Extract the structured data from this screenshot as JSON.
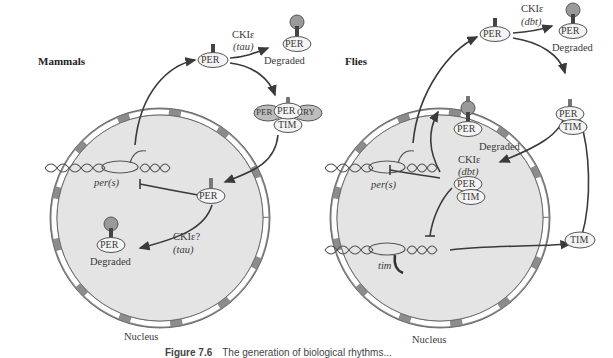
{
  "panels": {
    "mammals": {
      "title": "Mammals",
      "nucleus_label": "Nucleus",
      "gene_label": "per(s)",
      "cyto_per": "PER",
      "cyto_kinase": "CKIε",
      "cyto_kinase_gene": "(tau)",
      "cyto_degraded_protein": "PER",
      "cyto_degraded_label": "Degraded",
      "complex": {
        "center": "PER",
        "left": "PER",
        "right": "CRY",
        "bottom": "TIM"
      },
      "nuclear_per": "PER",
      "nuclear_kinase": "CKIε?",
      "nuclear_kinase_gene": "(tau)",
      "nuclear_degraded_protein": "PER",
      "nuclear_degraded_label": "Degraded",
      "phosphate": "PO4"
    },
    "flies": {
      "title": "Flies",
      "nucleus_label": "Nucleus",
      "gene_per_label": "per(s)",
      "gene_tim_label": "tim",
      "cyto_per": "PER",
      "cyto_kinase": "CKIε",
      "cyto_kinase_gene": "(dbt)",
      "cyto_degraded_protein": "PER",
      "cyto_degraded_label": "Degraded",
      "cyto_complex": {
        "top": "PER",
        "bottom": "TIM"
      },
      "cyto_tim": "TIM",
      "nuclear_complex": {
        "top": "PER",
        "bottom": "TIM"
      },
      "nuclear_kinase": "CKIε",
      "nuclear_kinase_gene": "(dbt)",
      "nuclear_degraded_protein": "PER",
      "nuclear_degraded_label": "Degraded",
      "phosphate": "PO4"
    }
  },
  "caption": {
    "figure_number": "Figure 7.6",
    "text": "The generation of biological rhythms..."
  },
  "colors": {
    "nucleus_fill": "#e4e4e4",
    "envelope_gray": "#8c8c8c",
    "pore_white": "#ffffff",
    "arrow": "#3a3a3a",
    "phospho_fill": "#9a9a9a"
  }
}
